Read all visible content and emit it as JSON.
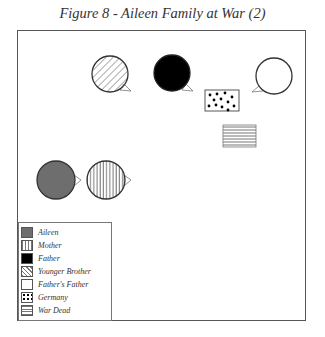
{
  "title": "Figure 8 - Aileen Family at War (2)",
  "legend": {
    "items": [
      {
        "label": "Aileen",
        "pattern": "solid-gray",
        "color": "#6e6e6e"
      },
      {
        "label": "Mother",
        "pattern": "vertical-lines"
      },
      {
        "label": "Father",
        "pattern": "solid-black",
        "color": "#000000"
      },
      {
        "label": "Younger Brother",
        "pattern": "diagonal-lines"
      },
      {
        "label": "Father's Father",
        "pattern": "blank"
      },
      {
        "label": "Germany",
        "pattern": "dots"
      },
      {
        "label": "War Dead",
        "pattern": "horizontal-lines"
      }
    ]
  },
  "nodes": [
    {
      "id": "younger-brother",
      "shape": "speech-circle",
      "pattern": "diagonal-lines",
      "cx": 110,
      "cy": 74,
      "r": 18,
      "tail": "right-down"
    },
    {
      "id": "father",
      "shape": "speech-circle",
      "pattern": "solid-black",
      "cx": 172,
      "cy": 73,
      "r": 18,
      "tail": "right-down"
    },
    {
      "id": "fathers-father",
      "shape": "speech-circle",
      "pattern": "blank",
      "cx": 274,
      "cy": 76,
      "r": 18,
      "tail": "left-down"
    },
    {
      "id": "germany",
      "shape": "rect",
      "pattern": "dots",
      "x": 205,
      "y": 90,
      "w": 34,
      "h": 21
    },
    {
      "id": "war-dead",
      "shape": "rect",
      "pattern": "horizontal-lines",
      "x": 223,
      "y": 125,
      "w": 33,
      "h": 22
    },
    {
      "id": "aileen",
      "shape": "speech-circle",
      "pattern": "solid-gray",
      "cx": 56,
      "cy": 180,
      "r": 19,
      "tail": "right"
    },
    {
      "id": "mother",
      "shape": "speech-circle",
      "pattern": "vertical-lines",
      "cx": 106,
      "cy": 180,
      "r": 19,
      "tail": "right"
    }
  ]
}
